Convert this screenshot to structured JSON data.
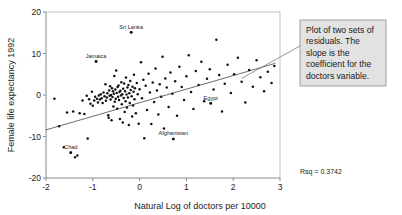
{
  "chart_data": {
    "type": "scatter",
    "title": "",
    "xlabel": "Natural Log of doctors per 10000",
    "ylabel": "Female life expectancy 1992",
    "xlim": [
      -2,
      3
    ],
    "ylim": [
      -20,
      20
    ],
    "xticks": [
      "-2",
      "-1",
      "0",
      "1",
      "2",
      "3"
    ],
    "xtick_values": [
      -2,
      -1,
      0,
      1,
      2,
      3
    ],
    "yticks": [
      "20",
      "10",
      "0",
      "-10",
      "-20"
    ],
    "ytick_values": [
      20,
      10,
      0,
      -10,
      -20
    ],
    "grid": false,
    "legend": "none",
    "statistic_label": "Rsq = 0.3742",
    "statistic_value": 0.3742,
    "fit_line": {
      "name": "regression line",
      "x_start": -2.0,
      "y_start": -8.4,
      "x_end": 2.9,
      "y_end": 7.6,
      "slope": 3.27,
      "intercept": -1.86
    },
    "annotation": {
      "text": "Plot of two sets of residuals. The slope is the coefficient for the doctors variable.",
      "lines": [
        "Plot of two sets of",
        "residuals. The",
        "slope is the",
        "coefficient for the",
        "doctors variable."
      ],
      "leader_target_x": 2.18,
      "leader_target_y": 4.0
    },
    "labeled_points": [
      {
        "label": "Sri Lanka",
        "x": -0.18,
        "y": 15.1
      },
      {
        "label": "Jamaica",
        "x": -0.93,
        "y": 8.1
      },
      {
        "label": "Egypt",
        "x": 1.52,
        "y": -2.0
      },
      {
        "label": "Afghanistan",
        "x": 0.72,
        "y": -10.6
      },
      {
        "label": "Chad",
        "x": -1.47,
        "y": -13.9
      }
    ],
    "points": [
      [
        -1.82,
        -0.9
      ],
      [
        -1.72,
        -7.5
      ],
      [
        -1.62,
        -12.6
      ],
      [
        -1.55,
        -4.2
      ],
      [
        -1.47,
        -13.9
      ],
      [
        -1.42,
        -4.0
      ],
      [
        -1.38,
        -15.0
      ],
      [
        -1.33,
        -14.6
      ],
      [
        -1.28,
        -4.4
      ],
      [
        -1.22,
        -1.3
      ],
      [
        -1.18,
        -4.6
      ],
      [
        -1.13,
        -0.2
      ],
      [
        -1.11,
        -10.5
      ],
      [
        -1.08,
        -1.0
      ],
      [
        -1.05,
        -2.1
      ],
      [
        -1.02,
        0.8
      ],
      [
        -1.0,
        -2.6
      ],
      [
        -0.97,
        -1.3
      ],
      [
        -0.95,
        -0.4
      ],
      [
        -0.93,
        8.1
      ],
      [
        -0.91,
        -0.9
      ],
      [
        -0.89,
        -1.8
      ],
      [
        -0.87,
        -0.1
      ],
      [
        -0.85,
        -1.1
      ],
      [
        -0.83,
        0.2
      ],
      [
        -0.81,
        -0.8
      ],
      [
        -0.79,
        -1.9
      ],
      [
        -0.77,
        0.6
      ],
      [
        -0.75,
        -0.3
      ],
      [
        -0.73,
        2.6
      ],
      [
        -0.72,
        -1.4
      ],
      [
        -0.7,
        -0.6
      ],
      [
        -0.69,
        0.4
      ],
      [
        -0.67,
        -4.9
      ],
      [
        -0.66,
        -5.5
      ],
      [
        -0.65,
        1.1
      ],
      [
        -0.64,
        -0.2
      ],
      [
        -0.63,
        2.1
      ],
      [
        -0.62,
        -1.1
      ],
      [
        -0.61,
        0.0
      ],
      [
        -0.6,
        -6.1
      ],
      [
        -0.59,
        1.6
      ],
      [
        -0.58,
        -0.5
      ],
      [
        -0.57,
        0.9
      ],
      [
        -0.56,
        -2.8
      ],
      [
        -0.55,
        0.3
      ],
      [
        -0.54,
        4.6
      ],
      [
        -0.53,
        -1.6
      ],
      [
        -0.52,
        1.3
      ],
      [
        -0.51,
        -0.9
      ],
      [
        -0.5,
        5.9
      ],
      [
        -0.49,
        0.5
      ],
      [
        -0.48,
        -3.3
      ],
      [
        -0.47,
        1.9
      ],
      [
        -0.46,
        -0.4
      ],
      [
        -0.45,
        2.3
      ],
      [
        -0.44,
        -1.2
      ],
      [
        -0.43,
        0.7
      ],
      [
        -0.42,
        -5.8
      ],
      [
        -0.41,
        1.0
      ],
      [
        -0.4,
        -0.1
      ],
      [
        -0.39,
        3.1
      ],
      [
        -0.38,
        -2.2
      ],
      [
        -0.37,
        0.2
      ],
      [
        -0.36,
        -6.6
      ],
      [
        -0.35,
        1.5
      ],
      [
        -0.34,
        -0.7
      ],
      [
        -0.33,
        2.8
      ],
      [
        -0.32,
        -4.1
      ],
      [
        -0.31,
        0.9
      ],
      [
        -0.3,
        -1.5
      ],
      [
        -0.29,
        4.2
      ],
      [
        -0.28,
        0.1
      ],
      [
        -0.27,
        -3.0
      ],
      [
        -0.26,
        1.8
      ],
      [
        -0.25,
        -0.6
      ],
      [
        -0.24,
        2.4
      ],
      [
        -0.23,
        -7.2
      ],
      [
        -0.22,
        0.4
      ],
      [
        -0.21,
        -1.9
      ],
      [
        -0.2,
        3.4
      ],
      [
        -0.19,
        1.2
      ],
      [
        -0.18,
        15.1
      ],
      [
        -0.17,
        -0.3
      ],
      [
        -0.16,
        -5.2
      ],
      [
        -0.15,
        2.0
      ],
      [
        -0.14,
        -2.5
      ],
      [
        -0.13,
        0.8
      ],
      [
        -0.12,
        4.9
      ],
      [
        -0.11,
        -1.0
      ],
      [
        -0.1,
        1.6
      ],
      [
        -0.08,
        -4.4
      ],
      [
        -0.06,
        2.9
      ],
      [
        -0.04,
        0.2
      ],
      [
        -0.02,
        -6.9
      ],
      [
        0.0,
        1.4
      ],
      [
        0.03,
        7.9
      ],
      [
        0.05,
        -0.8
      ],
      [
        0.08,
        3.7
      ],
      [
        0.1,
        -10.4
      ],
      [
        0.13,
        2.2
      ],
      [
        0.16,
        -3.6
      ],
      [
        0.19,
        5.1
      ],
      [
        0.22,
        0.6
      ],
      [
        0.25,
        -7.0
      ],
      [
        0.28,
        3.0
      ],
      [
        0.31,
        -1.7
      ],
      [
        0.34,
        6.4
      ],
      [
        0.37,
        1.1
      ],
      [
        0.4,
        -4.7
      ],
      [
        0.43,
        2.6
      ],
      [
        0.46,
        -0.4
      ],
      [
        0.49,
        9.2
      ],
      [
        0.52,
        -8.1
      ],
      [
        0.55,
        4.0
      ],
      [
        0.58,
        1.8
      ],
      [
        0.62,
        -2.9
      ],
      [
        0.66,
        5.4
      ],
      [
        0.7,
        0.3
      ],
      [
        0.72,
        -10.6
      ],
      [
        0.76,
        3.3
      ],
      [
        0.8,
        -5.0
      ],
      [
        0.85,
        6.8
      ],
      [
        0.9,
        1.9
      ],
      [
        0.95,
        -1.2
      ],
      [
        1.0,
        4.5
      ],
      [
        1.05,
        9.6
      ],
      [
        1.1,
        0.7
      ],
      [
        1.15,
        -3.4
      ],
      [
        1.2,
        5.8
      ],
      [
        1.26,
        2.4
      ],
      [
        1.32,
        8.0
      ],
      [
        1.38,
        -1.5
      ],
      [
        1.44,
        3.9
      ],
      [
        1.5,
        6.2
      ],
      [
        1.52,
        -2.0
      ],
      [
        1.58,
        1.3
      ],
      [
        1.64,
        13.3
      ],
      [
        1.7,
        4.8
      ],
      [
        1.76,
        -4.0
      ],
      [
        1.82,
        2.7
      ],
      [
        1.88,
        7.3
      ],
      [
        1.95,
        0.5
      ],
      [
        2.02,
        5.0
      ],
      [
        2.1,
        9.0
      ],
      [
        2.18,
        3.2
      ],
      [
        2.26,
        -1.8
      ],
      [
        2.34,
        6.0
      ],
      [
        2.42,
        2.0
      ],
      [
        2.5,
        8.4
      ],
      [
        2.58,
        4.3
      ],
      [
        2.66,
        0.9
      ],
      [
        2.74,
        5.6
      ],
      [
        2.82,
        2.9
      ],
      [
        2.88,
        7.0
      ]
    ]
  }
}
